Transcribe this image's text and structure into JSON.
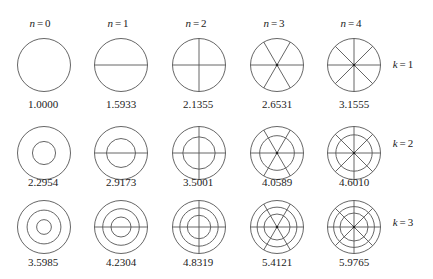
{
  "figure": {
    "column_headers": [
      {
        "var": "n",
        "value": "0"
      },
      {
        "var": "n",
        "value": "1"
      },
      {
        "var": "n",
        "value": "2"
      },
      {
        "var": "n",
        "value": "3"
      },
      {
        "var": "n",
        "value": "4"
      }
    ],
    "row_labels": [
      {
        "var": "k",
        "value": "1"
      },
      {
        "var": "k",
        "value": "2"
      },
      {
        "var": "k",
        "value": "3"
      }
    ],
    "values": [
      [
        "1.0000",
        "1.5933",
        "2.1355",
        "2.6531",
        "3.1555"
      ],
      [
        "2.2954",
        "2.9173",
        "3.5001",
        "4.0589",
        "4.6010"
      ],
      [
        "3.5985",
        "4.2304",
        "4.8319",
        "5.4121",
        "5.9765"
      ]
    ],
    "nodal_circle_ratios": [
      [
        [],
        [],
        [],
        [],
        []
      ],
      [
        [
          0.436
        ],
        [
          0.546
        ],
        [
          0.61
        ],
        [
          0.654
        ],
        [
          0.686
        ]
      ],
      [
        [
          0.278,
          0.638
        ],
        [
          0.377,
          0.69
        ],
        [
          0.442,
          0.724
        ],
        [
          0.49,
          0.75
        ],
        [
          0.528,
          0.77
        ]
      ]
    ],
    "stroke_color": "#555555"
  },
  "layout": {
    "col_x": [
      44,
      121,
      199,
      277,
      354
    ],
    "row_circle_y": [
      65,
      153,
      227
    ],
    "row_value_y": [
      104,
      182,
      262
    ],
    "header_y": 23,
    "row_label_x": 403,
    "radius": 26.5
  }
}
